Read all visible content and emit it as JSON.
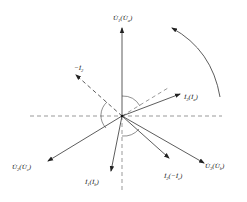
{
  "diagram": {
    "colors": {
      "line": "#333333",
      "dashed": "#555555",
      "background": "#ffffff"
    },
    "origin": {
      "x": 122,
      "y": 116
    },
    "vectors": [
      {
        "id": "U1",
        "label_main": "U̇",
        "label_sub": "1",
        "label_paren_main": "U̇",
        "label_paren_sub": "a",
        "end": [
          122,
          28
        ],
        "label_pos": [
          113,
          22
        ],
        "style": "solid"
      },
      {
        "id": "U2",
        "label_main": "U̇",
        "label_sub": "2",
        "label_paren_main": "U̇",
        "label_paren_sub": "c",
        "end": [
          48,
          161
        ],
        "label_pos": [
          12,
          167
        ],
        "style": "solid"
      },
      {
        "id": "U3",
        "label_main": "U̇",
        "label_sub": "3",
        "label_paren_main": "U̇",
        "label_paren_sub": "b",
        "end": [
          204,
          163
        ],
        "label_pos": [
          205,
          166
        ],
        "style": "solid"
      },
      {
        "id": "I1",
        "label_main": "İ",
        "label_sub": "1",
        "label_paren_main": "İ",
        "label_paren_sub": "b",
        "end": [
          111,
          171
        ],
        "label_pos": [
          84,
          183
        ],
        "style": "solid"
      },
      {
        "id": "I2",
        "label_main": "İ",
        "label_sub": "2",
        "label_paren_main": "−İ",
        "label_paren_sub": "c",
        "end": [
          169,
          158
        ],
        "label_pos": [
          163,
          178
        ],
        "style": "solid"
      },
      {
        "id": "I3",
        "label_main": "İ",
        "label_sub": "3",
        "label_paren_main": "İ",
        "label_paren_sub": "a",
        "end": [
          180,
          94
        ],
        "label_pos": [
          183,
          97
        ],
        "style": "solid"
      },
      {
        "id": "negI2",
        "label_main": "−İ",
        "label_sub": "2",
        "label_paren_main": "",
        "label_paren_sub": "",
        "end": [
          76,
          75
        ],
        "label_pos": [
          75,
          68
        ],
        "style": "dashed"
      }
    ],
    "axes": {
      "horizontal": {
        "x1": 30,
        "x2": 222,
        "y": 116
      },
      "vertical_down": {
        "x": 122,
        "y1": 116,
        "y2": 192
      },
      "diagonal_ref": {
        "x1": 122,
        "y1": 116,
        "x2": 168,
        "y2": 88
      }
    },
    "rotation_arrow": {
      "direction": "counterclockwise",
      "from": [
        220,
        97
      ],
      "to": [
        172,
        28
      ]
    }
  }
}
